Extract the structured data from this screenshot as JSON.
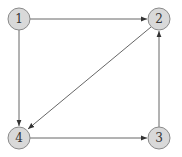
{
  "diagram": {
    "type": "directed-graph",
    "colors": {
      "node_fill": "#d9d9d9",
      "node_stroke": "#8a8a8a",
      "edge": "#555555",
      "label": "#333333"
    },
    "nodes": [
      {
        "id": "1",
        "label": "1",
        "x": 19,
        "y": 19
      },
      {
        "id": "2",
        "label": "2",
        "x": 159,
        "y": 19
      },
      {
        "id": "3",
        "label": "3",
        "x": 159,
        "y": 138
      },
      {
        "id": "4",
        "label": "4",
        "x": 19,
        "y": 138
      }
    ],
    "edges": [
      {
        "from": "1",
        "to": "2"
      },
      {
        "from": "1",
        "to": "4"
      },
      {
        "from": "2",
        "to": "4"
      },
      {
        "from": "4",
        "to": "3"
      },
      {
        "from": "3",
        "to": "2"
      }
    ]
  }
}
